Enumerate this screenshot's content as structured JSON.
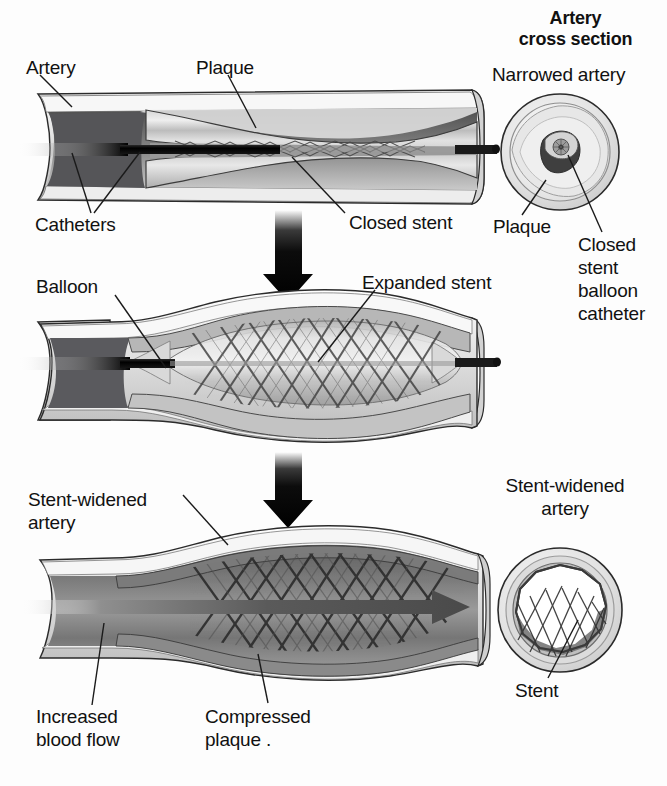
{
  "figure": {
    "background_color": "#fdfdfd",
    "text_color": "#111111"
  },
  "cross_section_heading": {
    "line1": "Artery",
    "line2": "cross section"
  },
  "panels": [
    {
      "id": "panel-narrowed",
      "step": 1,
      "description": "Narrowed artery with plaque and closed stent on catheters",
      "labels": [
        {
          "name": "artery",
          "text": "Artery"
        },
        {
          "name": "plaque",
          "text": "Plaque"
        },
        {
          "name": "catheters",
          "text": "Catheters"
        },
        {
          "name": "closed-stent",
          "text": "Closed stent"
        }
      ],
      "cross_section": {
        "title": "Narrowed artery",
        "labels": [
          {
            "name": "plaque",
            "text": "Plaque"
          },
          {
            "name": "closed-stent-balloon-catheter",
            "lines": [
              "Closed",
              "stent",
              "balloon",
              "catheter"
            ]
          }
        ]
      }
    },
    {
      "id": "panel-balloon-inflated",
      "step": 2,
      "description": "Balloon inflated expanding the stent",
      "labels": [
        {
          "name": "balloon",
          "text": "Balloon"
        },
        {
          "name": "expanded-stent",
          "text": "Expanded stent"
        }
      ],
      "cross_section": null
    },
    {
      "id": "panel-stent-widened",
      "step": 3,
      "description": "Stent-widened artery with compressed plaque and increased blood flow",
      "labels": [
        {
          "name": "stent-widened-artery",
          "lines": [
            "Stent-widened",
            "artery"
          ]
        },
        {
          "name": "increased-blood-flow",
          "lines": [
            "Increased",
            "blood flow"
          ]
        },
        {
          "name": "compressed-plaque",
          "lines": [
            "Compressed",
            "plaque ."
          ]
        }
      ],
      "cross_section": {
        "title_lines": [
          "Stent-widened",
          "artery"
        ],
        "labels": [
          {
            "name": "stent",
            "text": "Stent"
          }
        ]
      }
    }
  ],
  "arrows": [
    {
      "name": "flow-arrow-step1-to-step2",
      "direction": "down"
    },
    {
      "name": "flow-arrow-step2-to-step3",
      "direction": "down"
    },
    {
      "name": "blood-flow-arrow",
      "direction": "right"
    }
  ],
  "labels_flat": {
    "artery": "Artery",
    "plaque": "Plaque",
    "catheters": "Catheters",
    "closed_stent": "Closed stent",
    "narrowed_artery": "Narrowed artery",
    "cs_plaque": "Plaque",
    "cs_closed_l1": "Closed",
    "cs_closed_l2": "stent",
    "cs_closed_l3": "balloon",
    "cs_closed_l4": "catheter",
    "balloon": "Balloon",
    "expanded_stent": "Expanded stent",
    "stent_widened_l1": "Stent-widened",
    "stent_widened_l2": "artery",
    "increased_l1": "Increased",
    "increased_l2": "blood flow",
    "compressed_l1": "Compressed",
    "compressed_l2": "plaque .",
    "cs2_title_l1": "Stent-widened",
    "cs2_title_l2": "artery",
    "stent": "Stent",
    "heading_l1": "Artery",
    "heading_l2": "cross section"
  }
}
